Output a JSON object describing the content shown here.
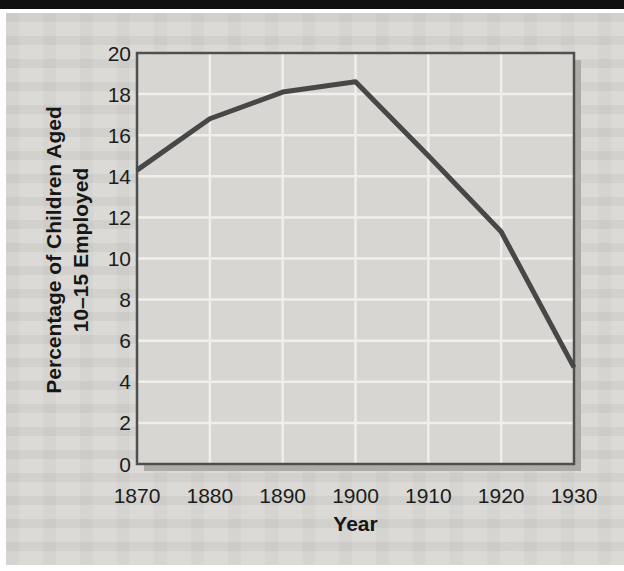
{
  "page": {
    "top_strip_color": "#0f0f0f",
    "paper_color": "#d8d7d3"
  },
  "chart_data": {
    "type": "line",
    "title": "",
    "xlabel": "Year",
    "ylabel": "Percentage of Children Aged 10–15 Employed",
    "ylabel_lines": [
      "Percentage of Children Aged",
      "10–15 Employed"
    ],
    "x": [
      1870,
      1880,
      1890,
      1900,
      1910,
      1920,
      1930
    ],
    "values": [
      14.3,
      16.8,
      18.1,
      18.6,
      15.0,
      11.3,
      4.7
    ],
    "xlim": [
      1870,
      1930
    ],
    "ylim": [
      0,
      20
    ],
    "x_ticks": [
      1870,
      1880,
      1890,
      1900,
      1910,
      1920,
      1930
    ],
    "y_ticks": [
      0,
      2,
      4,
      6,
      8,
      10,
      12,
      14,
      16,
      18,
      20
    ],
    "grid": "on",
    "legend": "none",
    "colors": {
      "line": "#474747",
      "grid": "#f0efeb",
      "plot_bg": "#d7d6d2",
      "frame": "#4f4f4f",
      "shadow": "#adacA7",
      "text": "#1c1c1c"
    }
  }
}
